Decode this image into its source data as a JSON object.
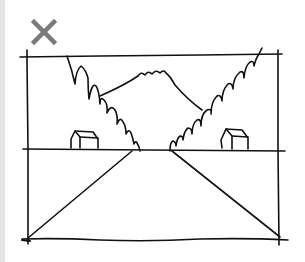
{
  "viewer": {
    "close_label": "Close",
    "close_icon": "close-icon",
    "close_color": "#7a7a7a",
    "side_strip_color": "#e4e4e4"
  },
  "image": {
    "alt": "Hand-drawn perspective sketch: a road converging toward a horizon between two forested hillsides, a mountain in the distance, and a small house on each side",
    "stroke_color": "#111111"
  }
}
